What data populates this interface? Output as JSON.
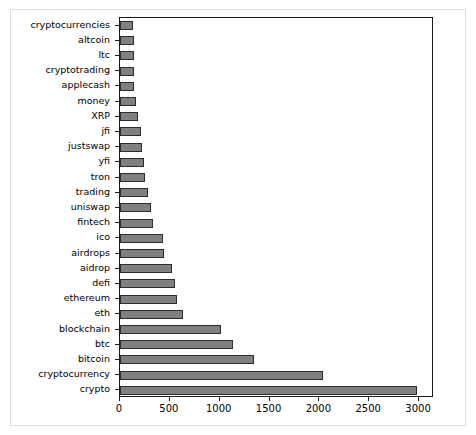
{
  "chart_data": {
    "type": "bar",
    "orientation": "horizontal",
    "title": "",
    "xlabel": "",
    "ylabel": "",
    "xlim": [
      0,
      3150
    ],
    "ylim": [
      0,
      24
    ],
    "grid": false,
    "legend": null,
    "xticks": [
      0,
      500,
      1000,
      1500,
      2000,
      2500,
      3000
    ],
    "xtick_labels": [
      "0",
      "500",
      "1000",
      "1500",
      "2000",
      "2500",
      "3000"
    ],
    "bar_color": "#808080",
    "bar_edge_color": "#2b2b2b",
    "axes_color": "#1a1a1a",
    "categories": [
      "cryptocurrencies",
      "altcoin",
      "ltc",
      "cryptotrading",
      "applecash",
      "money",
      "XRP",
      "jfi",
      "justswap",
      "yfi",
      "tron",
      "trading",
      "uniswap",
      "fintech",
      "ico",
      "airdrops",
      "aidrop",
      "defi",
      "ethereum",
      "eth",
      "blockchain",
      "btc",
      "bitcoin",
      "cryptocurrency",
      "crypto"
    ],
    "values": [
      135,
      140,
      140,
      145,
      145,
      160,
      180,
      215,
      220,
      240,
      250,
      285,
      310,
      330,
      430,
      440,
      520,
      550,
      570,
      630,
      1015,
      1135,
      1345,
      2040,
      2975
    ]
  }
}
